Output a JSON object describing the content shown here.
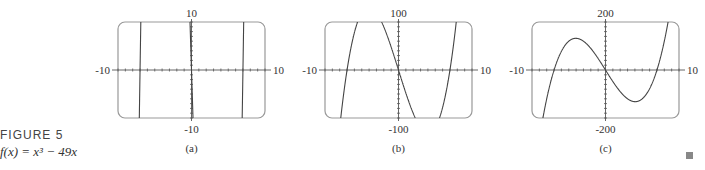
{
  "figure": {
    "label": "FIGURE 5",
    "function_text": "f(x) = x³ − 49x"
  },
  "chart_data": [
    {
      "type": "line",
      "panel": "(a)",
      "function": "x^3 - 49x",
      "xlim": [
        -10,
        10
      ],
      "ylim": [
        -10,
        10
      ],
      "x_tick_labels": [
        "-10",
        "10"
      ],
      "y_tick_labels": [
        "10",
        "-10"
      ],
      "x_tick_step": 1,
      "y_tick_step": 1,
      "grid": false
    },
    {
      "type": "line",
      "panel": "(b)",
      "function": "x^3 - 49x",
      "xlim": [
        -10,
        10
      ],
      "ylim": [
        -100,
        100
      ],
      "x_tick_labels": [
        "-10",
        "10"
      ],
      "y_tick_labels": [
        "100",
        "-100"
      ],
      "x_tick_step": 1,
      "y_tick_step": 10,
      "grid": false
    },
    {
      "type": "line",
      "panel": "(c)",
      "function": "x^3 - 49x",
      "xlim": [
        -10,
        10
      ],
      "ylim": [
        -200,
        200
      ],
      "x_tick_labels": [
        "-10",
        "10"
      ],
      "y_tick_labels": [
        "200",
        "-200"
      ],
      "x_tick_step": 1,
      "y_tick_step": 20,
      "grid": false
    }
  ]
}
